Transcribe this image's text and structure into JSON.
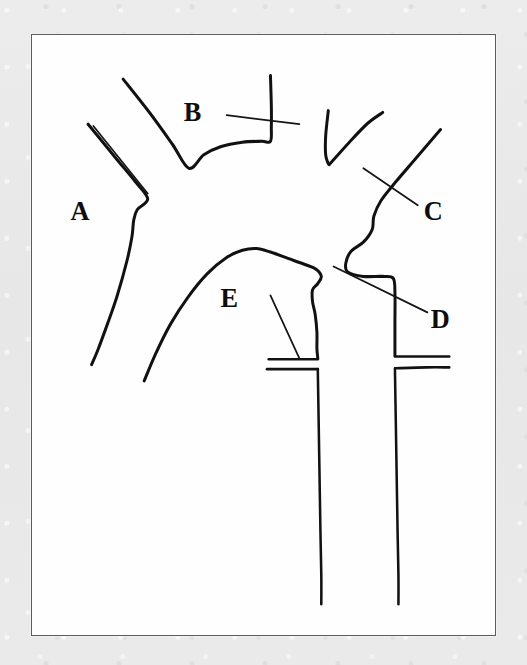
{
  "figure": {
    "kind": "line-drawing",
    "caption_text": "",
    "frame": {
      "x": 31,
      "y": 34,
      "width": 465,
      "height": 602,
      "border_color": "#5c5c5c",
      "fill_color": "#fefefe"
    },
    "page_background_color": "#e9e9e9",
    "ink_color": "#111111"
  },
  "labels": [
    {
      "id": "A",
      "text": "A",
      "x": 44,
      "y": 205
    },
    {
      "id": "B",
      "text": "B",
      "x": 173,
      "y": 95
    },
    {
      "id": "C",
      "text": "C",
      "x": 447,
      "y": 205
    },
    {
      "id": "D",
      "text": "D",
      "x": 455,
      "y": 325
    },
    {
      "id": "E",
      "text": "E",
      "x": 215,
      "y": 302
    }
  ],
  "leader_lines": [
    {
      "for": "A",
      "from": [
        70,
        101
      ],
      "to": [
        132,
        176
      ]
    },
    {
      "for": "B",
      "from": [
        222,
        89
      ],
      "to": [
        305,
        99
      ]
    },
    {
      "for": "C",
      "from": [
        378,
        148
      ],
      "to": [
        440,
        189
      ]
    },
    {
      "for": "D",
      "from": [
        344,
        257
      ],
      "to": [
        451,
        308
      ]
    },
    {
      "for": "E",
      "from": [
        272,
        289
      ],
      "to": [
        305,
        359
      ]
    }
  ],
  "strokes": [
    {
      "id": "outer-left-vessel",
      "role": "left-subclavian-outer-contour",
      "points": [
        [
          64,
          99
        ],
        [
          95,
          136
        ],
        [
          118,
          163
        ],
        [
          132,
          182
        ],
        [
          120,
          194
        ],
        [
          116,
          206
        ],
        [
          114,
          224
        ],
        [
          108,
          252
        ],
        [
          97,
          290
        ],
        [
          86,
          321
        ],
        [
          75,
          350
        ],
        [
          68,
          366
        ]
      ]
    },
    {
      "id": "upper-left-branch",
      "role": "brachiocephalic-branch",
      "points": [
        [
          104,
          49
        ],
        [
          134,
          86
        ],
        [
          160,
          121
        ],
        [
          179,
          148
        ],
        [
          196,
          133
        ],
        [
          215,
          124
        ],
        [
          240,
          119
        ],
        [
          262,
          118
        ],
        [
          272,
          118
        ],
        [
          273,
          102
        ],
        [
          273,
          78
        ],
        [
          272,
          45
        ]
      ]
    },
    {
      "id": "left-branch-v-left",
      "role": "left-common-carotid",
      "points": [
        [
          338,
          84
        ],
        [
          335,
          112
        ],
        [
          335,
          133
        ],
        [
          338,
          143
        ]
      ]
    },
    {
      "id": "left-branch-v-right",
      "role": "left-carotid-companion",
      "points": [
        [
          339,
          144
        ],
        [
          362,
          119
        ],
        [
          383,
          98
        ],
        [
          400,
          86
        ]
      ]
    },
    {
      "id": "right-upper-branch",
      "role": "right-subclavian-upper",
      "points": [
        [
          466,
          105
        ],
        [
          437,
          138
        ],
        [
          415,
          163
        ],
        [
          398,
          184
        ],
        [
          390,
          201
        ],
        [
          388,
          216
        ],
        [
          378,
          230
        ],
        [
          364,
          240
        ],
        [
          358,
          253
        ],
        [
          360,
          263
        ],
        [
          378,
          268
        ],
        [
          400,
          268
        ],
        [
          412,
          270
        ],
        [
          414,
          286
        ],
        [
          414,
          318
        ],
        [
          414,
          345
        ],
        [
          414,
          356
        ]
      ]
    },
    {
      "id": "inner-arch",
      "role": "aortic-arch-inner-contour",
      "points": [
        [
          128,
          384
        ],
        [
          141,
          354
        ],
        [
          158,
          321
        ],
        [
          178,
          291
        ],
        [
          200,
          265
        ],
        [
          222,
          247
        ],
        [
          240,
          239
        ],
        [
          256,
          237
        ],
        [
          272,
          241
        ],
        [
          292,
          248
        ],
        [
          312,
          255
        ],
        [
          324,
          260
        ],
        [
          330,
          268
        ],
        [
          326,
          276
        ],
        [
          320,
          283
        ],
        [
          320,
          296
        ],
        [
          323,
          310
        ],
        [
          325,
          330
        ],
        [
          325,
          348
        ],
        [
          326,
          359
        ]
      ]
    },
    {
      "id": "left-horizontal-branch-upper",
      "role": "descending-left-flange-upper",
      "points": [
        [
          270,
          360
        ],
        [
          300,
          360
        ],
        [
          326,
          360
        ]
      ]
    },
    {
      "id": "left-horizontal-branch-lower",
      "role": "descending-left-flange-lower",
      "points": [
        [
          268,
          371
        ],
        [
          300,
          371
        ],
        [
          326,
          371
        ]
      ]
    },
    {
      "id": "right-horizontal-branch-upper",
      "role": "descending-right-flange-upper",
      "points": [
        [
          414,
          357
        ],
        [
          450,
          357
        ],
        [
          476,
          357
        ]
      ]
    },
    {
      "id": "right-horizontal-branch-lower",
      "role": "descending-right-flange-lower",
      "points": [
        [
          414,
          370
        ],
        [
          450,
          369
        ],
        [
          476,
          369
        ]
      ]
    },
    {
      "id": "descending-left-wall",
      "role": "descending-aorta-left-wall",
      "points": [
        [
          326,
          371
        ],
        [
          327,
          430
        ],
        [
          328,
          490
        ],
        [
          329,
          550
        ],
        [
          330,
          600
        ],
        [
          330,
          632
        ]
      ]
    },
    {
      "id": "descending-right-wall",
      "role": "descending-aorta-right-wall",
      "points": [
        [
          414,
          371
        ],
        [
          415,
          430
        ],
        [
          416,
          490
        ],
        [
          417,
          550
        ],
        [
          418,
          600
        ],
        [
          418,
          632
        ]
      ]
    }
  ]
}
